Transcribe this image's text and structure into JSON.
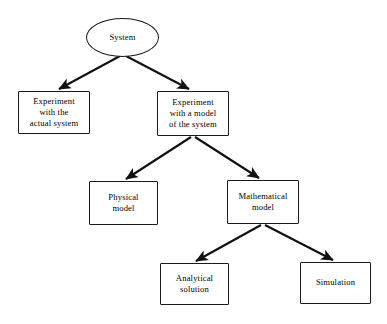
{
  "diagram": {
    "type": "tree-flowchart",
    "background_color": "#ffffff",
    "line_color": "#1a1a1a",
    "text_color": "#000000",
    "nodes": [
      {
        "id": "system",
        "label": "System",
        "shape": "ellipse"
      },
      {
        "id": "experiment_actual",
        "label": "Experiment\nwith the\nactual system",
        "shape": "rectangle"
      },
      {
        "id": "experiment_model",
        "label": "Experiment\nwith a model\nof the system",
        "shape": "rectangle"
      },
      {
        "id": "physical_model",
        "label": "Physical\nmodel",
        "shape": "rectangle"
      },
      {
        "id": "mathematical_model",
        "label": "Mathematical\nmodel",
        "shape": "rectangle"
      },
      {
        "id": "analytical_solution",
        "label": "Analytical\nsolution",
        "shape": "rectangle"
      },
      {
        "id": "simulation",
        "label": "Simulation",
        "shape": "rectangle"
      }
    ],
    "edges": [
      {
        "from": "system",
        "to": "experiment_actual",
        "style": "solid-arrow"
      },
      {
        "from": "system",
        "to": "experiment_model",
        "style": "solid-arrow"
      },
      {
        "from": "experiment_model",
        "to": "physical_model",
        "style": "solid-arrow"
      },
      {
        "from": "experiment_model",
        "to": "mathematical_model",
        "style": "solid-arrow"
      },
      {
        "from": "mathematical_model",
        "to": "analytical_solution",
        "style": "solid-arrow"
      },
      {
        "from": "mathematical_model",
        "to": "simulation",
        "style": "solid-arrow"
      }
    ]
  }
}
